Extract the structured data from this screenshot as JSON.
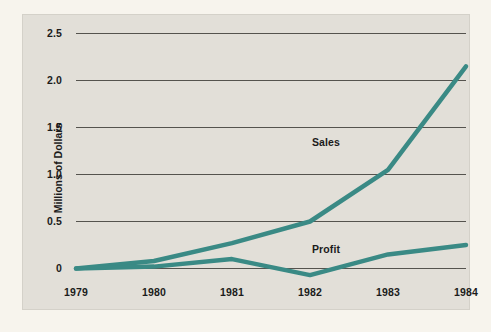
{
  "chart_data": {
    "type": "line",
    "title": "",
    "xlabel": "",
    "ylabel": "Millions of Dollars",
    "categories": [
      "1979",
      "1980",
      "1981",
      "1982",
      "1983",
      "1984"
    ],
    "x": [
      1979,
      1980,
      1981,
      1982,
      1983,
      1984
    ],
    "series": [
      {
        "name": "Sales",
        "values": [
          0.0,
          0.08,
          0.27,
          0.5,
          1.05,
          2.15
        ],
        "color": "#3a8a85"
      },
      {
        "name": "Profit",
        "values": [
          0.0,
          0.02,
          0.1,
          -0.07,
          0.15,
          0.25
        ],
        "color": "#3a8a85"
      }
    ],
    "y_ticks": [
      "0",
      "0.5",
      "1.0",
      "1.5",
      "2.0",
      "2.5"
    ],
    "y_tick_values": [
      0,
      0.5,
      1.0,
      1.5,
      2.0,
      2.5
    ],
    "ylim": [
      -0.15,
      2.6
    ],
    "xlim": [
      1979,
      1984
    ],
    "grid": "horizontal",
    "legend_position": "inline-annotations",
    "annotations": [
      {
        "text": "Sales",
        "series": "Sales",
        "near_x": 1982.2,
        "near_y": 1.35
      },
      {
        "text": "Profit",
        "series": "Profit",
        "near_x": 1982.3,
        "near_y": 0.33
      }
    ]
  },
  "colors": {
    "page_background": "#f7f4ed",
    "panel_background": "#e2dfd8",
    "gridline": "#55534e",
    "line_teal": "#3a8a85",
    "text": "#1b1b1b"
  }
}
